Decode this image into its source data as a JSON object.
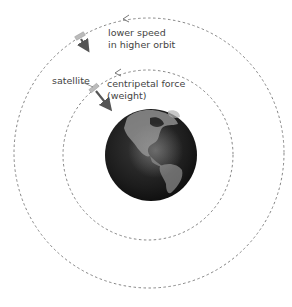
{
  "diagram": {
    "labels": {
      "outer_orbit": [
        "lower speed",
        "in higher orbit"
      ],
      "satellite": "satellite",
      "force": [
        "centripetal force",
        "(weight)"
      ]
    },
    "colors": {
      "orbit_line": "#777777",
      "arrow": "#555555",
      "earth_dark": "#1a1a1a",
      "earth_light": "#d8d8d8",
      "text": "#444444"
    },
    "orbits": [
      {
        "name": "outer-orbit",
        "cx": 149,
        "cy": 153,
        "r": 135
      },
      {
        "name": "inner-orbit",
        "cx": 148,
        "cy": 155,
        "r": 85
      }
    ],
    "earth": {
      "cx": 151,
      "cy": 155,
      "r": 46
    }
  }
}
